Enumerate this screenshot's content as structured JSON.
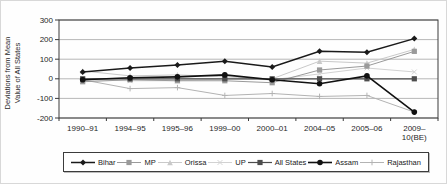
{
  "chart_data": {
    "type": "line",
    "categories": [
      "1990–91",
      "1994–95",
      "1995–96",
      "1999–00",
      "2000–01",
      "2004–05",
      "2005–06",
      "2009–\n10(BE)"
    ],
    "ylabel_lines": [
      "Deviations from Mean",
      "Value of All States"
    ],
    "ylim": [
      -200,
      300
    ],
    "yticks": [
      300,
      200,
      100,
      0,
      -100,
      -200
    ],
    "grid": true,
    "legend_position": "bottom",
    "axis_color": "#3a3a3a",
    "grid_color": "#9a9a9a",
    "series": [
      {
        "name": "Bihar",
        "marker": "diamond",
        "color": "#1a1a1a",
        "width": 1.5,
        "msize": 3,
        "values": [
          35,
          55,
          70,
          90,
          60,
          140,
          135,
          205
        ]
      },
      {
        "name": "MP",
        "marker": "square",
        "color": "#9a9a9a",
        "width": 1,
        "msize": 2.6,
        "values": [
          -15,
          -5,
          -10,
          -10,
          -20,
          45,
          65,
          140
        ]
      },
      {
        "name": "Orissa",
        "marker": "triangle",
        "color": "#c9c9c9",
        "width": 1,
        "msize": 2.8,
        "values": [
          40,
          15,
          20,
          10,
          0,
          90,
          80,
          150
        ]
      },
      {
        "name": "UP",
        "marker": "x",
        "color": "#d2d2d2",
        "width": 1,
        "msize": 2.4,
        "values": [
          -5,
          -10,
          -10,
          0,
          -5,
          25,
          55,
          35
        ]
      },
      {
        "name": "All States",
        "marker": "square",
        "color": "#4d4d4d",
        "width": 1.2,
        "msize": 2.6,
        "values": [
          0,
          0,
          0,
          0,
          0,
          0,
          0,
          0
        ]
      },
      {
        "name": "Assam",
        "marker": "circle",
        "color": "#111111",
        "width": 1.6,
        "msize": 2.8,
        "values": [
          -5,
          5,
          10,
          20,
          -5,
          -25,
          15,
          -170
        ]
      },
      {
        "name": "Rajasthan",
        "marker": "plus",
        "color": "#b3b3b3",
        "width": 1,
        "msize": 2.8,
        "values": [
          -5,
          -50,
          -45,
          -85,
          -75,
          -90,
          -85,
          -170
        ]
      }
    ]
  }
}
